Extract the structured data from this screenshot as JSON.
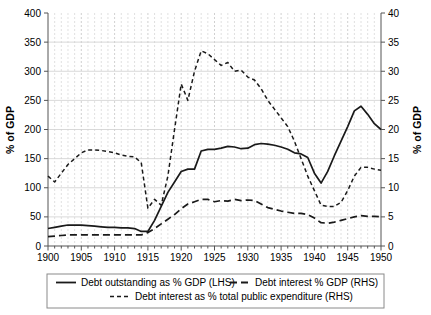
{
  "chart_data": {
    "type": "line",
    "title": "",
    "xlabel": "",
    "ylabel": "% of GDP",
    "ylabel_right": "% of GDP",
    "xlim": [
      1900,
      1950
    ],
    "ylim": [
      0,
      400
    ],
    "ylim_right": [
      0,
      40
    ],
    "grid": true,
    "legend_position": "below",
    "x_ticks": [
      1900,
      1905,
      1910,
      1915,
      1920,
      1925,
      1930,
      1935,
      1940,
      1945,
      1950
    ],
    "x_tick_labels": [
      "1900",
      "1905",
      "1910",
      "1915",
      "1920",
      "1925",
      "1930",
      "1935",
      "1940",
      "1945",
      "1950"
    ],
    "y_ticks_left": [
      0,
      50,
      100,
      150,
      200,
      250,
      300,
      350,
      400
    ],
    "y_tick_labels_left": [
      "0",
      "50",
      "100",
      "150",
      "200",
      "250",
      "300",
      "350",
      "400"
    ],
    "y_ticks_right": [
      0,
      5,
      10,
      15,
      20,
      25,
      30,
      35,
      40
    ],
    "y_tick_labels_right": [
      "0",
      "5",
      "10",
      "15",
      "20",
      "25",
      "30",
      "35",
      "40"
    ],
    "x": [
      1900,
      1901,
      1902,
      1903,
      1904,
      1905,
      1906,
      1907,
      1908,
      1909,
      1910,
      1911,
      1912,
      1913,
      1914,
      1915,
      1916,
      1917,
      1918,
      1919,
      1920,
      1921,
      1922,
      1923,
      1924,
      1925,
      1926,
      1927,
      1928,
      1929,
      1930,
      1931,
      1932,
      1933,
      1934,
      1935,
      1936,
      1937,
      1938,
      1939,
      1940,
      1941,
      1942,
      1943,
      1944,
      1945,
      1946,
      1947,
      1948,
      1949,
      1950
    ],
    "series": [
      {
        "name": "Debt outstanding as % GDP (LHS)",
        "axis": "left",
        "style": "solid",
        "values": [
          30,
          32,
          34,
          36,
          36,
          36,
          35,
          34,
          33,
          32,
          32,
          31,
          31,
          30,
          25,
          25,
          44,
          68,
          92,
          110,
          128,
          132,
          132,
          163,
          166,
          166,
          168,
          171,
          170,
          167,
          168,
          174,
          176,
          175,
          173,
          170,
          166,
          160,
          158,
          152,
          125,
          108,
          128,
          155,
          180,
          205,
          232,
          240,
          226,
          210,
          200
        ]
      },
      {
        "name": "Debt interest % GDP (RHS)",
        "axis": "right",
        "style": "longdash",
        "values": [
          1.6,
          1.7,
          1.8,
          1.9,
          1.9,
          1.9,
          1.9,
          1.9,
          1.9,
          1.9,
          1.9,
          1.9,
          1.9,
          1.9,
          1.9,
          2.3,
          3.0,
          3.8,
          4.6,
          5.4,
          6.4,
          7.2,
          7.6,
          8.0,
          8.0,
          7.6,
          7.8,
          7.7,
          8.0,
          7.8,
          7.9,
          7.8,
          7.2,
          6.6,
          6.3,
          6.0,
          5.8,
          5.6,
          5.6,
          5.4,
          4.8,
          4.0,
          3.9,
          4.1,
          4.4,
          4.7,
          5.0,
          5.2,
          5.1,
          5.1,
          5.0
        ]
      },
      {
        "name": "Debt interest as % total public expenditure (RHS)",
        "axis": "right",
        "style": "dotdash",
        "values": [
          12.0,
          11.0,
          12.5,
          14.0,
          15.0,
          16.0,
          16.5,
          16.5,
          16.4,
          16.2,
          16.0,
          15.6,
          15.4,
          15.3,
          14.3,
          6.5,
          8.0,
          7.0,
          12.0,
          20.0,
          27.8,
          25.0,
          30.0,
          33.5,
          33.0,
          32.0,
          31.0,
          31.5,
          30.0,
          30.2,
          29.0,
          28.5,
          27.0,
          25.0,
          23.5,
          22.0,
          20.5,
          18.0,
          15.0,
          12.0,
          9.5,
          7.0,
          6.8,
          6.8,
          7.5,
          9.5,
          12.0,
          13.5,
          13.5,
          13.2,
          13.0
        ]
      }
    ],
    "legend": [
      {
        "label": "Debt outstanding as % GDP (LHS)",
        "style": "solid"
      },
      {
        "label": "Debt interest % GDP (RHS)",
        "style": "longdash"
      },
      {
        "label": "Debt interest as % total public expenditure (RHS)",
        "style": "dotdash"
      }
    ],
    "colors": {
      "line": "#1a1a1a",
      "grid": "#d4d4d4",
      "axis": "#555555",
      "background": "#ffffff"
    }
  }
}
